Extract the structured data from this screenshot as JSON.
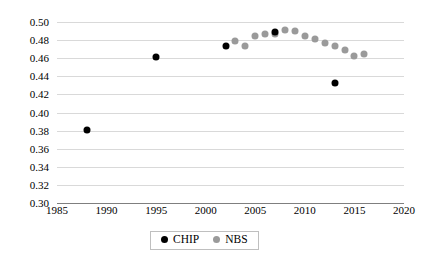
{
  "chart_data": {
    "type": "scatter",
    "title": "",
    "subtitle": "",
    "xlabel": "",
    "ylabel": "",
    "xlim": [
      1985,
      2020
    ],
    "ylim": [
      0.3,
      0.5
    ],
    "xticks": [
      1985,
      1990,
      1995,
      2000,
      2005,
      2010,
      2015,
      2020
    ],
    "xtick_labels": [
      "1985",
      "1990",
      "1995",
      "2000",
      "2005",
      "2010",
      "2015",
      "2020"
    ],
    "yticks": [
      0.3,
      0.32,
      0.34,
      0.36,
      0.38,
      0.4,
      0.42,
      0.44,
      0.46,
      0.48,
      0.5
    ],
    "ytick_labels": [
      "0.30",
      "0.32",
      "0.34",
      "0.36",
      "0.38",
      "0.40",
      "0.42",
      "0.44",
      "0.46",
      "0.48",
      "0.50"
    ],
    "grid": true,
    "grid_axis": "y",
    "legend_position": "bottom-center",
    "series": [
      {
        "name": "CHIP",
        "color": "#000000",
        "marker": "circle",
        "points": [
          {
            "x": 1988,
            "y": 0.381
          },
          {
            "x": 1995,
            "y": 0.461
          },
          {
            "x": 2002,
            "y": 0.474
          },
          {
            "x": 2007,
            "y": 0.489
          },
          {
            "x": 2013,
            "y": 0.433
          }
        ]
      },
      {
        "name": "NBS",
        "color": "#9a9a9a",
        "marker": "circle",
        "points": [
          {
            "x": 2003,
            "y": 0.479
          },
          {
            "x": 2004,
            "y": 0.473
          },
          {
            "x": 2005,
            "y": 0.485
          },
          {
            "x": 2006,
            "y": 0.487
          },
          {
            "x": 2007,
            "y": 0.487
          },
          {
            "x": 2008,
            "y": 0.491
          },
          {
            "x": 2009,
            "y": 0.49
          },
          {
            "x": 2010,
            "y": 0.484
          },
          {
            "x": 2011,
            "y": 0.481
          },
          {
            "x": 2012,
            "y": 0.477
          },
          {
            "x": 2013,
            "y": 0.474
          },
          {
            "x": 2014,
            "y": 0.469
          },
          {
            "x": 2015,
            "y": 0.462
          },
          {
            "x": 2016,
            "y": 0.465
          }
        ]
      }
    ]
  },
  "legend": {
    "items": [
      {
        "label": "CHIP",
        "color": "#000000"
      },
      {
        "label": "NBS",
        "color": "#9a9a9a"
      }
    ]
  }
}
